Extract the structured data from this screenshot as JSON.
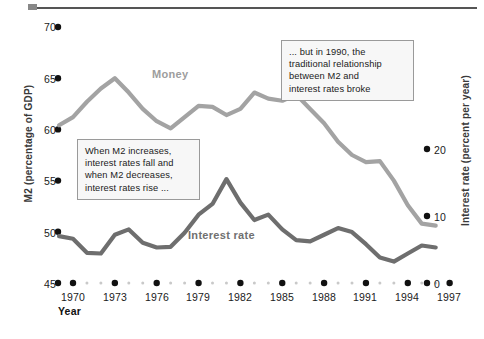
{
  "figure": {
    "left_axis_title": "M2 (percentage of GDP)",
    "right_axis_title": "Interest rate (percent per year)",
    "x_axis_title": "Year"
  },
  "series_labels": {
    "money": "Money",
    "interest": "Interest rate"
  },
  "annotations": {
    "left": [
      "When M2 increases,",
      "interest rates fall and",
      "when M2 decreases,",
      "interest rates rise ..."
    ],
    "right": [
      "... but in 1990, the",
      "traditional relationship",
      "between M2 and",
      "interest rates broke"
    ]
  },
  "colors": {
    "money_line": "#a3a3a3",
    "interest_line": "#6e6e6e",
    "tick_dot": "#111111",
    "minor_dot": "#c9c9c9",
    "rule": "#555555"
  },
  "chart_data": {
    "type": "line",
    "title": "",
    "xlabel": "Year",
    "ylabel": "M2 (percentage of GDP)",
    "y2label": "Interest rate (percent per year)",
    "xlim": [
      1969,
      1997
    ],
    "ylim": [
      45,
      70
    ],
    "y2lim": [
      0,
      25
    ],
    "ytick_labels": [
      "45",
      "50",
      "55",
      "60",
      "65",
      "70"
    ],
    "ytick_values": [
      45,
      50,
      55,
      60,
      65,
      70
    ],
    "y2tick_labels": [
      "0",
      "10",
      "20"
    ],
    "y2tick_values": [
      0,
      10,
      20
    ],
    "xtick_labels": [
      "1970",
      "1973",
      "1976",
      "1979",
      "1982",
      "1985",
      "1988",
      "1991",
      "1994",
      "1997"
    ],
    "xtick_values": [
      1970,
      1973,
      1976,
      1979,
      1982,
      1985,
      1988,
      1991,
      1994,
      1997
    ],
    "grid": false,
    "legend": "inline-labels",
    "x": [
      1969,
      1970,
      1971,
      1972,
      1973,
      1974,
      1975,
      1976,
      1977,
      1978,
      1979,
      1980,
      1981,
      1982,
      1983,
      1984,
      1985,
      1986,
      1987,
      1988,
      1989,
      1990,
      1991,
      1992,
      1993,
      1994,
      1995,
      1996
    ],
    "series": [
      {
        "name": "Money",
        "axis": "left",
        "units": "percent of GDP",
        "values": [
          60.4,
          61.2,
          62.7,
          64.0,
          65.0,
          63.6,
          62.0,
          60.8,
          60.1,
          61.2,
          62.3,
          62.2,
          61.4,
          62.0,
          63.6,
          63.0,
          62.8,
          63.4,
          62.0,
          60.6,
          58.8,
          57.5,
          56.8,
          56.9,
          55.0,
          52.6,
          50.8,
          50.6
        ]
      },
      {
        "name": "Interest rate",
        "axis": "right",
        "units": "percent per year",
        "values": [
          7.0,
          6.6,
          4.5,
          4.4,
          7.2,
          8.0,
          6.0,
          5.3,
          5.4,
          7.5,
          10.2,
          11.8,
          15.5,
          12.0,
          9.4,
          10.2,
          8.0,
          6.4,
          6.2,
          7.2,
          8.2,
          7.6,
          5.8,
          3.8,
          3.2,
          4.4,
          5.6,
          5.3
        ]
      }
    ]
  }
}
